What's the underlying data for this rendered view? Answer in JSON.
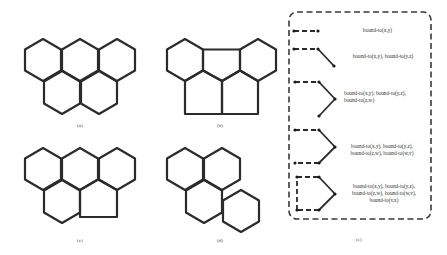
{
  "panels": {
    "a": {
      "label": "(a)"
    },
    "b": {
      "label": "(b)"
    },
    "c": {
      "label": "(c)"
    },
    "d": {
      "label": "(d)"
    },
    "e": {
      "label": "(e)"
    }
  },
  "legend": {
    "items": [
      {
        "text": "bound-to(x,y)"
      },
      {
        "text": "bound-to(x,y), bound-to(y,z)"
      },
      {
        "text": "bound-to(x,y), bound-to(y,z), bound-to(z,w)"
      },
      {
        "text": "bound-to(x,y), bound-to(y,z), bound-to(z,w), bound-to(w,v)"
      },
      {
        "text": "bound-to(x,y), bound-to(y,z), bound-to(z,w), bound-to(w,v), bound-to(v,x)"
      }
    ]
  },
  "colors": {
    "line": "#2b2b2b",
    "text": "#333333",
    "background": "#ffffff"
  }
}
